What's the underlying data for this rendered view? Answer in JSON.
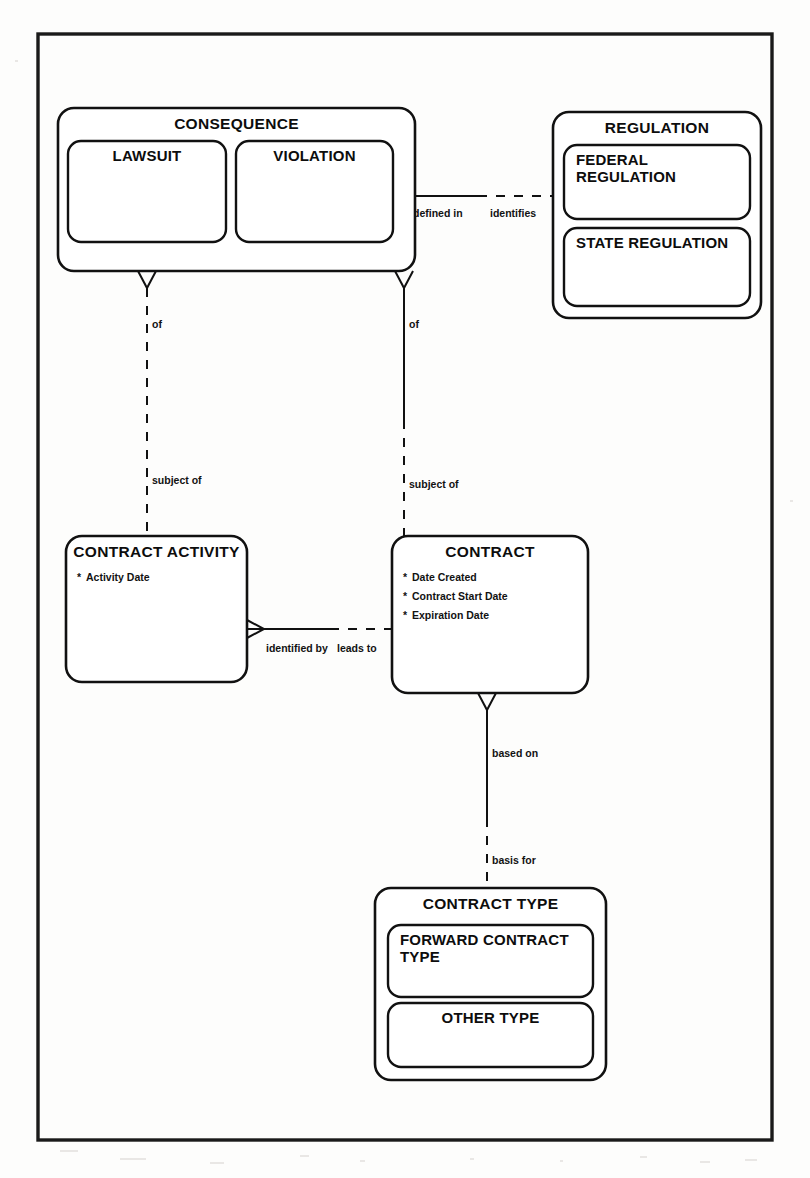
{
  "diagram": {
    "notation": "Barker / crow's-foot ER notation",
    "frame": {
      "x": 38,
      "y": 34,
      "width": 734,
      "height": 1106
    },
    "entities": [
      {
        "id": "consequence",
        "name": "CONSEQUENCE",
        "x": 58,
        "y": 108,
        "width": 357,
        "height": 163,
        "attributes": [],
        "sub_entities": [
          {
            "id": "lawsuit",
            "name": "LAWSUIT",
            "x": 68,
            "y": 141,
            "width": 158,
            "height": 101,
            "align": "middle"
          },
          {
            "id": "violation",
            "name": "VIOLATION",
            "x": 236,
            "y": 141,
            "width": 157,
            "height": 101,
            "align": "middle"
          }
        ]
      },
      {
        "id": "regulation",
        "name": "REGULATION",
        "x": 553,
        "y": 112,
        "width": 208,
        "height": 206,
        "attributes": [],
        "sub_entities": [
          {
            "id": "federal-regulation",
            "name": "FEDERAL REGULATION",
            "name_lines": [
              "FEDERAL",
              "REGULATION"
            ],
            "x": 564,
            "y": 145,
            "width": 186,
            "height": 74,
            "align": "start"
          },
          {
            "id": "state-regulation",
            "name": "STATE REGULATION",
            "name_lines": [
              "STATE REGULATION"
            ],
            "x": 564,
            "y": 228,
            "width": 186,
            "height": 78,
            "align": "start"
          }
        ]
      },
      {
        "id": "contract-activity",
        "name": "CONTRACT ACTIVITY",
        "x": 66,
        "y": 536,
        "width": 181,
        "height": 146,
        "attributes": [
          {
            "marker": "*",
            "label": "Activity Date"
          }
        ],
        "sub_entities": []
      },
      {
        "id": "contract",
        "name": "CONTRACT",
        "x": 392,
        "y": 536,
        "width": 196,
        "height": 157,
        "attributes": [
          {
            "marker": "*",
            "label": "Date Created"
          },
          {
            "marker": "*",
            "label": "Contract Start Date"
          },
          {
            "marker": "*",
            "label": "Expiration Date"
          }
        ],
        "sub_entities": []
      },
      {
        "id": "contract-type",
        "name": "CONTRACT TYPE",
        "x": 375,
        "y": 888,
        "width": 231,
        "height": 192,
        "attributes": [],
        "sub_entities": [
          {
            "id": "forward-contract-type",
            "name": "FORWARD CONTRACT TYPE",
            "name_lines": [
              "FORWARD CONTRACT",
              "TYPE"
            ],
            "x": 388,
            "y": 925,
            "width": 205,
            "height": 72,
            "align": "start"
          },
          {
            "id": "other-type",
            "name": "OTHER TYPE",
            "name_lines": [
              "OTHER TYPE"
            ],
            "x": 388,
            "y": 1003,
            "width": 205,
            "height": 64,
            "align": "middle"
          }
        ]
      }
    ],
    "relationships": [
      {
        "id": "consequence-regulation",
        "from": "consequence",
        "to": "regulation",
        "orientation": "horizontal",
        "from_label": "defined in",
        "to_label": "identifies",
        "from_label_x": 413,
        "from_label_y": 217,
        "to_label_x": 490,
        "to_label_y": 217,
        "solid": {
          "x1": 395,
          "y1": 196,
          "x2": 478,
          "y2": 196
        },
        "dashed": {
          "x1": 478,
          "y1": 196,
          "x2": 553,
          "y2": 196
        },
        "crowfoot": {
          "x": 395,
          "y": 196,
          "direction": "right"
        }
      },
      {
        "id": "consequence-contract-activity",
        "from": "consequence",
        "to": "contract-activity",
        "orientation": "vertical",
        "from_label": "of",
        "to_label": "subject of",
        "from_label_x": 152,
        "from_label_y": 328,
        "to_label_x": 152,
        "to_label_y": 484,
        "solid": null,
        "dashed": {
          "x1": 147,
          "y1": 288,
          "x2": 147,
          "y2": 536
        },
        "crowfoot": {
          "x": 147,
          "y": 271,
          "direction": "down"
        }
      },
      {
        "id": "consequence-contract",
        "from": "consequence",
        "to": "contract",
        "orientation": "vertical",
        "from_label": "of",
        "to_label": "subject of",
        "from_label_x": 409,
        "from_label_y": 328,
        "to_label_x": 409,
        "to_label_y": 488,
        "solid": {
          "x1": 404,
          "y1": 288,
          "x2": 404,
          "y2": 420
        },
        "dashed": {
          "x1": 404,
          "y1": 420,
          "x2": 404,
          "y2": 536
        },
        "crowfoot": {
          "x": 404,
          "y": 271,
          "direction": "down"
        }
      },
      {
        "id": "contract-activity-contract",
        "from": "contract-activity",
        "to": "contract",
        "orientation": "horizontal",
        "from_label": "identified by",
        "to_label": "leads to",
        "from_label_x": 266,
        "from_label_y": 652,
        "to_label_x": 337,
        "to_label_y": 652,
        "solid": {
          "x1": 247,
          "y1": 629,
          "x2": 330,
          "y2": 629
        },
        "dashed": {
          "x1": 330,
          "y1": 629,
          "x2": 392,
          "y2": 629
        },
        "crowfoot": {
          "x": 247,
          "y": 629,
          "direction": "right"
        }
      },
      {
        "id": "contract-contract-type",
        "from": "contract",
        "to": "contract-type",
        "orientation": "vertical",
        "from_label": "based on",
        "to_label": "basis for",
        "from_label_x": 492,
        "from_label_y": 757,
        "to_label_x": 492,
        "to_label_y": 864,
        "solid": {
          "x1": 487,
          "y1": 710,
          "x2": 487,
          "y2": 818
        },
        "dashed": {
          "x1": 487,
          "y1": 818,
          "x2": 487,
          "y2": 888
        },
        "crowfoot": {
          "x": 487,
          "y": 693,
          "direction": "down"
        }
      }
    ]
  }
}
